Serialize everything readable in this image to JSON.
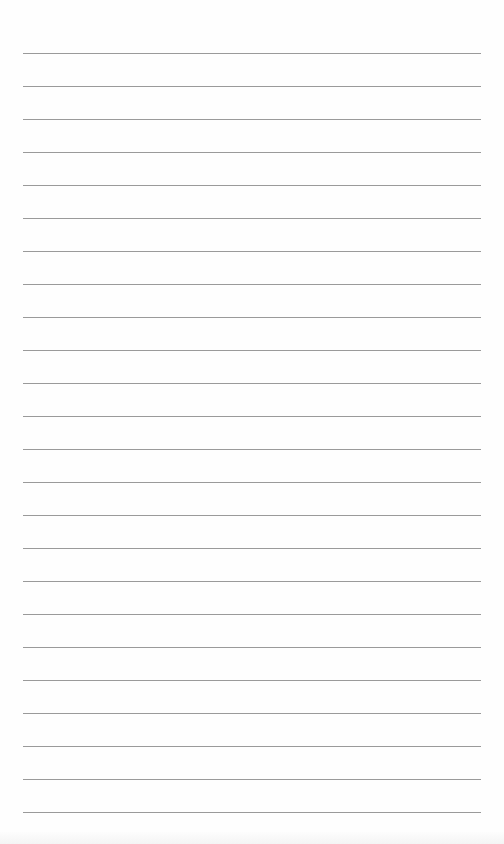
{
  "document": {
    "type": "lined-paper",
    "background_color": "#fefefe",
    "line_color": "#9a9a9a",
    "line_count": 24,
    "first_line_y": 53,
    "line_spacing": 33,
    "line_left": 23,
    "line_right": 481,
    "text_content": ""
  }
}
